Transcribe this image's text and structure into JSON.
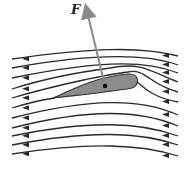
{
  "diagram": {
    "title": "",
    "force_label": "F",
    "colors": {
      "streamline": "#2a2a2a",
      "airfoil_fill": "#8c8c8c",
      "airfoil_stroke": "#333333",
      "force_arrow": "#8a8a8a",
      "center_dot": "#000000"
    },
    "flow_direction": "right-to-left",
    "streamline_count": 11,
    "streamlines": [
      {
        "d": "M178,56 C140,46 90,48 12,59"
      },
      {
        "d": "M178,65 C150,55 100,52 12,68"
      },
      {
        "d": "M178,73 C150,62 110,58 12,78"
      },
      {
        "d": "M178,82 C148,70 140,62 110,68 C80,72 40,80 12,89"
      },
      {
        "d": "M178,92 C150,85 145,68 128,72 C110,74 60,84 12,98"
      },
      {
        "d": "M178,102 C150,97 142,85 137,82 M55,98 C40,100 25,104 12,108"
      },
      {
        "d": "M178,115 C140,98 90,98 12,118"
      },
      {
        "d": "M178,126 C140,110 90,108 12,128"
      },
      {
        "d": "M178,136 C140,122 90,120 12,136"
      },
      {
        "d": "M178,145 C140,132 90,130 12,145"
      },
      {
        "d": "M178,156 C140,144 90,142 12,154"
      }
    ],
    "airfoil": {
      "path": "M53,98 C75,88 100,76 128,74 C140,73 140,86 132,88 C110,92 80,95 53,98 Z"
    },
    "force_vector": {
      "x1": 105,
      "y1": 86,
      "x2": 86,
      "y2": 7
    },
    "center_of_pressure": {
      "cx": 105,
      "cy": 86
    }
  }
}
